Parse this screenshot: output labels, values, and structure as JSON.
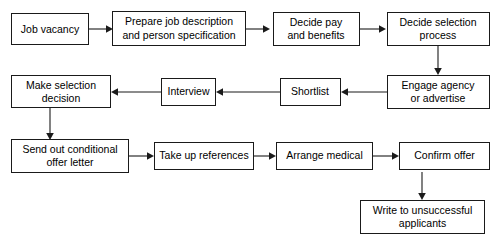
{
  "diagram": {
    "type": "flowchart",
    "background_color": "#ffffff",
    "box_fill": "#ffffff",
    "box_border_color": "#1a1a1a",
    "connector_color": "#1a1a1a",
    "nodes": [
      {
        "id": "job-vacancy",
        "label_line1": "Job vacancy",
        "label_line2": ""
      },
      {
        "id": "prepare-job-desc",
        "label_line1": "Prepare job description",
        "label_line2": "and person specification"
      },
      {
        "id": "decide-pay",
        "label_line1": "Decide pay",
        "label_line2": "and benefits"
      },
      {
        "id": "decide-selection",
        "label_line1": "Decide selection",
        "label_line2": "process"
      },
      {
        "id": "engage-agency",
        "label_line1": "Engage agency",
        "label_line2": "or advertise"
      },
      {
        "id": "shortlist",
        "label_line1": "Shortlist",
        "label_line2": ""
      },
      {
        "id": "interview",
        "label_line1": "Interview",
        "label_line2": ""
      },
      {
        "id": "make-selection",
        "label_line1": "Make selection",
        "label_line2": "decision"
      },
      {
        "id": "send-offer-letter",
        "label_line1": "Send out conditional",
        "label_line2": "offer letter"
      },
      {
        "id": "take-up-references",
        "label_line1": "Take up references",
        "label_line2": ""
      },
      {
        "id": "arrange-medical",
        "label_line1": "Arrange medical",
        "label_line2": ""
      },
      {
        "id": "confirm-offer",
        "label_line1": "Confirm offer",
        "label_line2": ""
      },
      {
        "id": "write-unsuccessful",
        "label_line1": "Write to unsuccessful",
        "label_line2": "applicants"
      }
    ],
    "edges": [
      {
        "from": "job-vacancy",
        "to": "prepare-job-desc",
        "direction": "right"
      },
      {
        "from": "prepare-job-desc",
        "to": "decide-pay",
        "direction": "right"
      },
      {
        "from": "decide-pay",
        "to": "decide-selection",
        "direction": "right"
      },
      {
        "from": "decide-selection",
        "to": "engage-agency",
        "direction": "down"
      },
      {
        "from": "engage-agency",
        "to": "shortlist",
        "direction": "left"
      },
      {
        "from": "shortlist",
        "to": "interview",
        "direction": "left"
      },
      {
        "from": "interview",
        "to": "make-selection",
        "direction": "left"
      },
      {
        "from": "make-selection",
        "to": "send-offer-letter",
        "direction": "down"
      },
      {
        "from": "send-offer-letter",
        "to": "take-up-references",
        "direction": "right"
      },
      {
        "from": "take-up-references",
        "to": "arrange-medical",
        "direction": "right"
      },
      {
        "from": "arrange-medical",
        "to": "confirm-offer",
        "direction": "right"
      },
      {
        "from": "confirm-offer",
        "to": "write-unsuccessful",
        "direction": "down"
      }
    ]
  }
}
